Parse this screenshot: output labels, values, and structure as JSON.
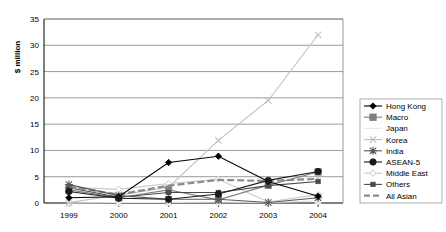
{
  "chart_data": {
    "type": "line",
    "title": "",
    "xlabel": "",
    "ylabel": "$ million",
    "categories": [
      "1999",
      "2000",
      "2001",
      "2002",
      "2003",
      "2004"
    ],
    "ylim": [
      0,
      35
    ],
    "ytick_step": 5,
    "yticks": [
      "0",
      "5",
      "10",
      "15",
      "20",
      "25",
      "30",
      "35"
    ],
    "grid": "horizontal",
    "legend_position": "right",
    "series": [
      {
        "name": "Hong Kong",
        "color": "#000000",
        "marker": "diamond",
        "dash": "solid",
        "values": [
          1.0,
          1.2,
          7.7,
          8.9,
          4.1,
          1.3
        ]
      },
      {
        "name": "Macro",
        "color": "#808080",
        "marker": "square",
        "dash": "solid",
        "values": [
          2.5,
          1.0,
          2.5,
          0.6,
          3.4,
          5.9
        ]
      },
      {
        "name": "Japan",
        "color": "#e8e8e8",
        "marker": "triangle",
        "dash": "solid",
        "values": [
          0.0,
          0.1,
          0.1,
          0.2,
          0.1,
          0.4
        ]
      },
      {
        "name": "Korea",
        "color": "#c0c0c0",
        "marker": "cross",
        "dash": "solid",
        "values": [
          0.1,
          1.5,
          3.0,
          11.9,
          19.5,
          32.0
        ]
      },
      {
        "name": "India",
        "color": "#595959",
        "marker": "star",
        "dash": "solid",
        "values": [
          3.5,
          1.4,
          0.7,
          0.7,
          0.1,
          1.0
        ]
      },
      {
        "name": "ASEAN-5",
        "color": "#1a1a1a",
        "marker": "circle",
        "dash": "solid",
        "values": [
          2.2,
          0.9,
          0.7,
          1.7,
          4.3,
          6.0
        ]
      },
      {
        "name": "Middle East",
        "color": "#c9c9c9",
        "marker": "open-diamond",
        "dash": "solid",
        "values": [
          3.0,
          2.6,
          3.7,
          4.5,
          0.2,
          1.6
        ]
      },
      {
        "name": "Others",
        "color": "#4a4a4a",
        "marker": "small-square",
        "dash": "solid",
        "values": [
          2.9,
          1.1,
          2.0,
          2.0,
          3.3,
          4.1
        ]
      },
      {
        "name": "All Asian",
        "color": "#8a8a8a",
        "marker": "none",
        "dash": "dashed",
        "values": [
          3.1,
          1.6,
          3.3,
          4.4,
          4.2,
          4.6
        ]
      }
    ]
  }
}
